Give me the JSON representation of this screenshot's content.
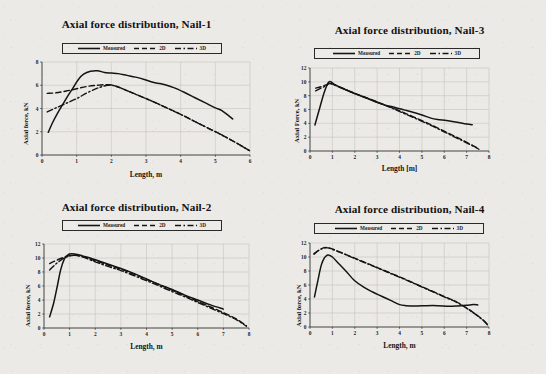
{
  "figure": {
    "background_color": "#eceae6",
    "ink_color": "#151515",
    "panel_count": 4,
    "layout": "2x2 grid of line charts"
  },
  "legend": {
    "measured_label": "Measured",
    "two_d_label": "2D",
    "three_d_label": "3D",
    "styles": {
      "measured": "solid",
      "two_d": "dashed",
      "three_d": "dash-dot"
    }
  },
  "chart_data": [
    {
      "type": "line",
      "title": "Axial force distribution, Nail-1",
      "xlabel": "Length, m",
      "ylabel": "Axial force, kN",
      "xlim": [
        0,
        6
      ],
      "ylim": [
        0,
        8
      ],
      "xticks": [
        "0",
        "1",
        "2",
        "3",
        "4",
        "5",
        "6"
      ],
      "yticks": [
        "0",
        "2",
        "4",
        "6",
        "8"
      ],
      "grid": true,
      "legend_position": "top-center",
      "series": [
        {
          "name": "Measured",
          "style": "solid",
          "x": [
            0.18,
            0.3,
            0.45,
            0.6,
            0.75,
            0.9,
            1.05,
            1.2,
            1.4,
            1.6,
            1.8,
            2.0,
            2.2,
            2.45,
            2.7,
            2.95,
            3.2,
            3.4,
            3.55,
            3.8,
            4.1,
            4.4,
            4.7,
            5.0,
            5.2,
            5.5
          ],
          "y": [
            1.95,
            2.75,
            3.6,
            4.35,
            5.1,
            5.8,
            6.5,
            6.95,
            7.2,
            7.25,
            7.1,
            7.05,
            7.0,
            6.85,
            6.7,
            6.5,
            6.25,
            6.15,
            6.05,
            5.8,
            5.4,
            4.95,
            4.5,
            4.05,
            3.8,
            3.1
          ]
        },
        {
          "name": "2D",
          "style": "dashed",
          "x": [
            0.15,
            0.4,
            0.7,
            1.0,
            1.3,
            1.6,
            1.9,
            2.1,
            2.4,
            2.8,
            3.2,
            3.6,
            4.0,
            4.4,
            4.8,
            5.2,
            5.6,
            6.0
          ],
          "y": [
            5.3,
            5.35,
            5.5,
            5.7,
            5.9,
            6.0,
            6.05,
            5.95,
            5.6,
            5.1,
            4.6,
            4.05,
            3.5,
            2.9,
            2.3,
            1.7,
            1.05,
            0.35
          ]
        },
        {
          "name": "3D",
          "style": "dashdot",
          "x": [
            0.15,
            0.4,
            0.7,
            1.0,
            1.3,
            1.6,
            1.9,
            2.1,
            2.4,
            2.8,
            3.2,
            3.6,
            4.0,
            4.4,
            4.8,
            5.2,
            5.6,
            6.0
          ],
          "y": [
            3.7,
            4.05,
            4.45,
            4.85,
            5.35,
            5.75,
            6.0,
            5.95,
            5.6,
            5.1,
            4.6,
            4.05,
            3.5,
            2.9,
            2.3,
            1.7,
            1.05,
            0.35
          ]
        }
      ]
    },
    {
      "type": "line",
      "title": "Axial force distribution, Nail-3",
      "xlabel": "Length [m]",
      "ylabel": "Axial Force, kN",
      "xlim": [
        0,
        8
      ],
      "ylim": [
        0,
        12
      ],
      "xticks": [
        "0",
        "1",
        "2",
        "3",
        "4",
        "5",
        "6",
        "7",
        "8"
      ],
      "yticks": [
        "0",
        "2",
        "4",
        "6",
        "8",
        "10",
        "12"
      ],
      "grid": true,
      "legend_position": "top-center",
      "series": [
        {
          "name": "Measured",
          "style": "solid",
          "x": [
            0.22,
            0.45,
            0.65,
            0.85,
            1.1,
            1.5,
            2.0,
            2.5,
            3.0,
            3.4,
            3.8,
            4.2,
            4.6,
            5.0,
            5.4,
            5.7,
            6.1,
            6.5,
            6.9,
            7.25
          ],
          "y": [
            3.75,
            6.4,
            8.6,
            10.0,
            9.6,
            9.0,
            8.3,
            7.7,
            7.05,
            6.6,
            6.3,
            5.95,
            5.6,
            5.2,
            4.75,
            4.55,
            4.4,
            4.2,
            3.95,
            3.8
          ]
        },
        {
          "name": "2D",
          "style": "dashed",
          "x": [
            0.25,
            0.5,
            0.75,
            0.9,
            1.4,
            2.0,
            2.6,
            3.2,
            3.8,
            4.4,
            5.0,
            5.6,
            6.2,
            6.8,
            7.3,
            7.55
          ],
          "y": [
            9.1,
            9.3,
            9.6,
            9.8,
            9.15,
            8.35,
            7.6,
            6.85,
            6.1,
            5.25,
            4.4,
            3.5,
            2.55,
            1.6,
            0.75,
            0.3
          ]
        },
        {
          "name": "3D",
          "style": "dashdot",
          "x": [
            0.25,
            0.5,
            0.75,
            0.9,
            1.4,
            2.0,
            2.6,
            3.2,
            3.8,
            4.4,
            5.0,
            5.6,
            6.2,
            6.8,
            7.3,
            7.55
          ],
          "y": [
            8.7,
            9.1,
            9.5,
            9.75,
            9.1,
            8.3,
            7.55,
            6.8,
            6.0,
            5.15,
            4.3,
            3.4,
            2.45,
            1.5,
            0.7,
            0.25
          ]
        }
      ]
    },
    {
      "type": "line",
      "title": "Axial force distribution, Nail-2",
      "xlabel": "Length, m",
      "ylabel": "Axial force, kN",
      "xlim": [
        0,
        8
      ],
      "ylim": [
        0,
        12
      ],
      "xticks": [
        "0",
        "1",
        "2",
        "3",
        "4",
        "5",
        "6",
        "7",
        "8"
      ],
      "yticks": [
        "0",
        "2",
        "4",
        "6",
        "8",
        "10",
        "12"
      ],
      "grid": true,
      "legend_position": "top-center",
      "series": [
        {
          "name": "Measured",
          "style": "solid",
          "x": [
            0.22,
            0.38,
            0.52,
            0.65,
            0.8,
            0.95,
            1.1,
            1.3,
            1.5,
            1.8,
            2.2,
            2.6,
            3.0,
            3.5,
            4.0,
            4.5,
            5.0,
            5.5,
            6.0,
            6.5,
            7.0
          ],
          "y": [
            1.6,
            3.6,
            6.0,
            8.3,
            9.9,
            10.5,
            10.6,
            10.5,
            10.3,
            10.0,
            9.5,
            9.0,
            8.5,
            7.8,
            7.0,
            6.2,
            5.5,
            4.7,
            4.0,
            3.3,
            2.7
          ]
        },
        {
          "name": "2D",
          "style": "dashed",
          "x": [
            0.22,
            0.45,
            0.7,
            0.95,
            1.2,
            1.5,
            2.0,
            2.5,
            3.0,
            3.5,
            4.0,
            4.5,
            5.0,
            5.5,
            6.0,
            6.5,
            7.0,
            7.5,
            7.9
          ],
          "y": [
            9.2,
            9.6,
            10.0,
            10.3,
            10.4,
            10.2,
            9.6,
            9.0,
            8.4,
            7.7,
            6.95,
            6.2,
            5.4,
            4.6,
            3.8,
            3.0,
            2.2,
            1.3,
            0.3
          ]
        },
        {
          "name": "3D",
          "style": "dashdot",
          "x": [
            0.22,
            0.45,
            0.7,
            0.95,
            1.2,
            1.5,
            2.0,
            2.5,
            3.0,
            3.5,
            4.0,
            4.5,
            5.0,
            5.5,
            6.0,
            6.5,
            7.0,
            7.5,
            7.9
          ],
          "y": [
            8.3,
            9.1,
            9.8,
            10.25,
            10.4,
            10.15,
            9.45,
            8.8,
            8.2,
            7.5,
            6.75,
            6.0,
            5.2,
            4.45,
            3.65,
            2.85,
            2.05,
            1.2,
            0.25
          ]
        }
      ]
    },
    {
      "type": "line",
      "title": "Axial force distribution, Nail-4",
      "xlabel": "Length, m",
      "ylabel": "Axial force, kN",
      "xlim": [
        0,
        8
      ],
      "ylim": [
        0,
        12
      ],
      "xticks": [
        "0",
        "1",
        "2",
        "3",
        "4",
        "5",
        "6",
        "7",
        "8"
      ],
      "yticks": [
        "0",
        "2",
        "4",
        "6",
        "8",
        "10",
        "12"
      ],
      "grid": true,
      "legend_position": "top-center",
      "series": [
        {
          "name": "Measured",
          "style": "solid",
          "x": [
            0.2,
            0.35,
            0.5,
            0.65,
            0.8,
            1.0,
            1.3,
            1.6,
            2.0,
            2.4,
            2.8,
            3.2,
            3.6,
            4.0,
            4.3,
            4.7,
            5.2,
            5.7,
            6.2,
            6.6,
            7.0,
            7.3,
            7.5
          ],
          "y": [
            4.3,
            6.6,
            8.8,
            9.9,
            10.3,
            10.0,
            9.0,
            8.0,
            6.6,
            5.7,
            5.0,
            4.4,
            3.8,
            3.2,
            3.05,
            3.0,
            3.05,
            3.05,
            2.95,
            3.0,
            3.1,
            3.2,
            3.15
          ]
        },
        {
          "name": "2D",
          "style": "dashed",
          "x": [
            0.18,
            0.4,
            0.6,
            0.8,
            1.2,
            1.8,
            2.4,
            3.0,
            3.6,
            4.2,
            4.8,
            5.4,
            6.0,
            6.6,
            7.2,
            7.7,
            7.95
          ],
          "y": [
            10.5,
            11.0,
            11.3,
            11.35,
            10.9,
            10.1,
            9.3,
            8.5,
            7.7,
            6.9,
            6.05,
            5.2,
            4.35,
            3.5,
            2.3,
            1.1,
            0.3
          ]
        },
        {
          "name": "3D",
          "style": "dashdot",
          "x": [
            0.18,
            0.4,
            0.6,
            0.8,
            1.2,
            1.8,
            2.4,
            3.0,
            3.6,
            4.2,
            4.8,
            5.4,
            6.0,
            6.6,
            7.2,
            7.7,
            7.95
          ],
          "y": [
            10.4,
            10.95,
            11.25,
            11.3,
            10.85,
            10.05,
            9.25,
            8.45,
            7.65,
            6.85,
            6.0,
            5.15,
            4.3,
            3.45,
            2.25,
            1.05,
            0.25
          ]
        }
      ]
    }
  ]
}
